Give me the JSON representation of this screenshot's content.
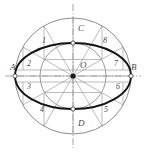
{
  "figure": {
    "colors": {
      "construction_line": "#9a9a9a",
      "ellipse_curve": "#141414",
      "circle_outline": "#8c8c8c",
      "centerline": "#9a9a9a",
      "label_text": "#4a4a4a",
      "background": "#ffffff"
    },
    "geometry": {
      "center": {
        "x": 73,
        "y": 76
      },
      "major_circle_radius": 58,
      "minor_circle_radius": 33,
      "ellipse_semi_major": 58,
      "ellipse_semi_minor": 33,
      "radial_line_count": 12,
      "radial_step_degrees": 30
    }
  },
  "axis_labels": [
    {
      "id": "A",
      "text": "A",
      "x": 10,
      "y": 70,
      "role": "major-axis-left-endpoint"
    },
    {
      "id": "B",
      "text": "B",
      "x": 131,
      "y": 70,
      "role": "major-axis-right-endpoint"
    },
    {
      "id": "C",
      "text": "C",
      "x": 78,
      "y": 31,
      "role": "minor-axis-top-endpoint"
    },
    {
      "id": "D",
      "text": "D",
      "x": 78,
      "y": 126,
      "role": "minor-axis-bottom-endpoint"
    },
    {
      "id": "O",
      "text": "O",
      "x": 80,
      "y": 68,
      "role": "center-point"
    }
  ],
  "point_labels": [
    {
      "id": "1",
      "text": "1",
      "x": 42,
      "y": 43,
      "angle_deg": 150
    },
    {
      "id": "2",
      "text": "2",
      "x": 27,
      "y": 66,
      "angle_deg": 170
    },
    {
      "id": "3",
      "text": "3",
      "x": 27,
      "y": 89,
      "angle_deg": 190
    },
    {
      "id": "4",
      "text": "4",
      "x": 40,
      "y": 112,
      "angle_deg": 210
    },
    {
      "id": "5",
      "text": "5",
      "x": 104,
      "y": 112,
      "angle_deg": 330
    },
    {
      "id": "6",
      "text": "6",
      "x": 116,
      "y": 89,
      "angle_deg": 350
    },
    {
      "id": "7",
      "text": "7",
      "x": 114,
      "y": 66,
      "angle_deg": 10
    },
    {
      "id": "8",
      "text": "8",
      "x": 103,
      "y": 43,
      "angle_deg": 30
    }
  ],
  "node_markers": [
    {
      "name": "A-endpoint",
      "x": 15,
      "y": 76
    },
    {
      "name": "B-endpoint",
      "x": 131,
      "y": 76
    },
    {
      "name": "C-endpoint",
      "x": 73,
      "y": 43
    },
    {
      "name": "D-endpoint",
      "x": 73,
      "y": 109
    },
    {
      "name": "center-O",
      "x": 73,
      "y": 76
    }
  ]
}
